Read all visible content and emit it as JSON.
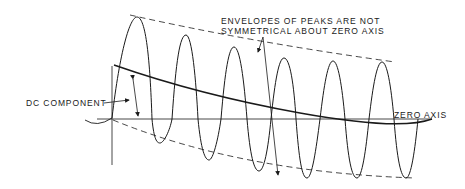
{
  "diagram": {
    "labels": {
      "dc_component": "DC COMPONENT",
      "envelopes_line1": "ENVELOPES OF PEAKS ARE NOT",
      "envelopes_line2": "SYMMETRICAL ABOUT ZERO AXIS",
      "zero_axis": "ZERO AXIS"
    },
    "colors": {
      "ink": "#1a1a1a",
      "background": "#ffffff"
    },
    "waveform": {
      "peaks": [
        [
          137,
          17
        ],
        [
          186,
          35
        ],
        [
          234,
          47
        ],
        [
          284,
          58
        ],
        [
          333,
          61
        ],
        [
          382,
          62
        ]
      ],
      "troughs": [
        [
          160,
          143
        ],
        [
          209,
          160
        ],
        [
          259,
          171
        ],
        [
          307,
          178
        ],
        [
          357,
          178
        ],
        [
          406,
          178
        ]
      ]
    },
    "zero_axis_y": 119,
    "upper_envelope": "dashed",
    "lower_envelope": "dashed",
    "dc_component_curve": "exponential decay to zero axis"
  }
}
